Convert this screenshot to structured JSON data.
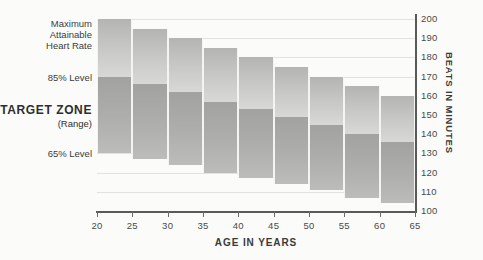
{
  "chart_data": {
    "type": "bar",
    "title": "",
    "xlabel": "AGE IN YEARS",
    "ylabel": "BEATS IN MINUTES",
    "categories": [
      20,
      25,
      30,
      35,
      40,
      45,
      50,
      55,
      60
    ],
    "x_tick_labels": [
      "20",
      "25",
      "30",
      "35",
      "40",
      "45",
      "50",
      "55",
      "60",
      "65"
    ],
    "x_ticks": [
      20,
      25,
      30,
      35,
      40,
      45,
      50,
      55,
      60,
      65
    ],
    "xlim": [
      20,
      65
    ],
    "y_tick_labels": [
      "200",
      "190",
      "180",
      "170",
      "160",
      "150",
      "140",
      "130",
      "120",
      "110",
      "100"
    ],
    "y_ticks": [
      200,
      190,
      180,
      170,
      160,
      150,
      140,
      130,
      120,
      110,
      100
    ],
    "ylim": [
      100,
      200
    ],
    "grid": true,
    "legend_position": "left-annotations",
    "series": [
      {
        "name": "Maximum Attainable Heart Rate",
        "values": [
          200,
          195,
          190,
          185,
          180,
          175,
          170,
          165,
          160
        ]
      },
      {
        "name": "85% Level",
        "values": [
          170,
          166,
          162,
          157,
          153,
          149,
          145,
          140,
          136
        ]
      },
      {
        "name": "65% Level",
        "values": [
          130,
          127,
          124,
          120,
          117,
          114,
          111,
          107,
          104
        ]
      }
    ],
    "annotations": [
      "Maximum Attainable Heart Rate",
      "85% Level",
      "TARGET ZONE (Range)",
      "65% Level"
    ],
    "colors": {
      "upper_band": "#c9c9c7",
      "lower_band": "#adadab",
      "axis": "#595957",
      "gridline": "#e2e2df",
      "background": "#fbfbfa",
      "text": "#3a3a38"
    }
  },
  "labels": {
    "max_hr_line1": "Maximum",
    "max_hr_line2": "Attainable",
    "max_hr_line3": "Heart Rate",
    "level_85": "85% Level",
    "target_zone": "TARGET ZONE",
    "target_zone_sub": "(Range)",
    "level_65": "65% Level",
    "x_axis_title": "AGE IN YEARS",
    "y_axis_title": "BEATS IN MINUTES"
  }
}
